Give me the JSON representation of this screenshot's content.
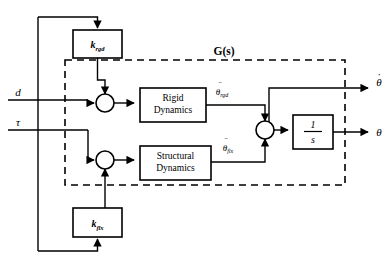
{
  "diagram": {
    "title": "G(s)",
    "type": "control-system-block-diagram",
    "colors": {
      "line": "#000000",
      "background": "#ffffff",
      "block_fill": "#ffffff"
    },
    "plant_boundary": {
      "label": "G(s)",
      "style": "dashed"
    },
    "inputs": [
      {
        "id": "d",
        "label": "d",
        "y": 100
      },
      {
        "id": "tau",
        "label": "τ",
        "y": 130
      }
    ],
    "outputs": [
      {
        "id": "theta_dot",
        "label": "θ",
        "accent": "dot",
        "y": 88
      },
      {
        "id": "theta",
        "label": "θ",
        "accent": "none",
        "y": 135
      }
    ],
    "gain_blocks": [
      {
        "id": "k_rgd",
        "symbol": "k",
        "subscript": "rgd",
        "x": 73,
        "y": 30,
        "w": 49,
        "h": 28
      },
      {
        "id": "k_flx",
        "symbol": "k",
        "subscript": "flx",
        "x": 73,
        "y": 208,
        "w": 49,
        "h": 29
      }
    ],
    "dynamics_blocks": [
      {
        "id": "rigid_dynamics",
        "line1": "Rigid",
        "line2": "Dynamics",
        "x": 140,
        "y": 88,
        "w": 66,
        "h": 34
      },
      {
        "id": "structural_dynamics",
        "line1": "Structural",
        "line2": "Dynamics",
        "x": 140,
        "y": 146,
        "w": 71,
        "h": 34
      }
    ],
    "integrator_block": {
      "id": "integrator",
      "numerator": "1",
      "denominator": "s",
      "x": 293,
      "y": 115,
      "w": 40,
      "h": 34
    },
    "signal_labels": [
      {
        "id": "theta_ddot_rgd",
        "symbol": "θ",
        "accent": "ddot",
        "subscript": "rgd",
        "x": 222,
        "y": 94
      },
      {
        "id": "theta_ddot_flx",
        "symbol": "θ",
        "accent": "ddot",
        "subscript": "flx",
        "x": 222,
        "y": 150
      }
    ],
    "summing_junctions": [
      {
        "id": "sum_rigid",
        "cx": 105,
        "cy": 103,
        "r": 9
      },
      {
        "id": "sum_flex",
        "cx": 105,
        "cy": 160,
        "r": 9
      },
      {
        "id": "sum_output",
        "cx": 265,
        "cy": 130,
        "r": 9
      }
    ]
  }
}
